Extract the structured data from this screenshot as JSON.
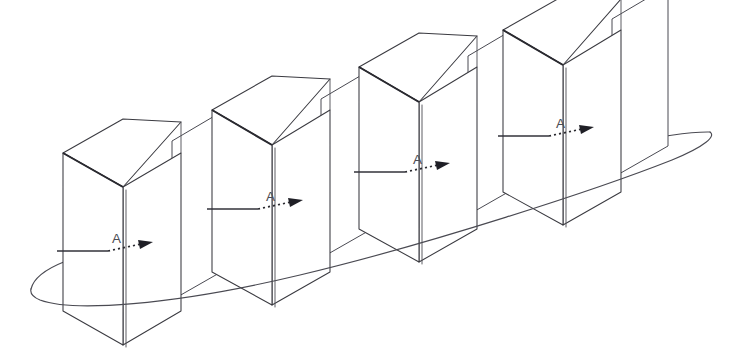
{
  "diagram": {
    "kind": "technical-line-drawing",
    "background_color": "#ffffff",
    "line_color": "#3a3a40",
    "accent_color": "#2a2a30",
    "canvas": {
      "width": 744,
      "height": 355
    },
    "units": [
      {
        "id": "unit-1",
        "label": "A",
        "label_x": 112,
        "label_y": 243,
        "box": {
          "front": "63,153 63,311 123,345 123,187",
          "right": "123,187 123,345 181,311 181,153",
          "top": "63,153 123,119 181,122 123,187",
          "bevel": "63,153 123,187"
        },
        "panel": "172,141 172,300 228,268 228,108",
        "lead_solid": {
          "x1": 57,
          "y1": 251,
          "x2": 108,
          "y2": 251
        },
        "lead_dotted": {
          "x1": 108,
          "y1": 251,
          "x2": 143,
          "y2": 244
        },
        "arrow_tip": {
          "x": 153,
          "y": 242
        }
      },
      {
        "id": "unit-2",
        "label": "A",
        "label_x": 266,
        "label_y": 201,
        "box": {
          "front": "212,110 212,272 272,305 272,145",
          "right": "272,145 272,305 330,272 330,110",
          "top": "212,110 272,76 330,79 272,145",
          "bevel": "212,110 272,145"
        },
        "panel": "321,99 321,258 377,226 377,66",
        "lead_solid": {
          "x1": 207,
          "y1": 209,
          "x2": 258,
          "y2": 209
        },
        "lead_dotted": {
          "x1": 258,
          "y1": 209,
          "x2": 293,
          "y2": 202
        },
        "arrow_tip": {
          "x": 303,
          "y": 200
        }
      },
      {
        "id": "unit-3",
        "label": "A",
        "label_x": 413,
        "label_y": 164,
        "box": {
          "front": "359,67 359,229 419,262 419,102",
          "right": "419,102 419,262 477,229 477,67",
          "top": "359,67 419,33 477,36 419,102",
          "bevel": "359,67 419,102"
        },
        "panel": "468,56 468,215 524,183 524,23",
        "lead_solid": {
          "x1": 354,
          "y1": 172,
          "x2": 405,
          "y2": 172
        },
        "lead_dotted": {
          "x1": 405,
          "y1": 172,
          "x2": 440,
          "y2": 165
        },
        "arrow_tip": {
          "x": 450,
          "y": 163
        }
      },
      {
        "id": "unit-4",
        "label": "A",
        "label_x": 556,
        "label_y": 128,
        "box": {
          "front": "503,30 503,192 563,225 563,65",
          "right": "563,65 563,225 621,192 621,30",
          "top": "503,30 563,-4 621,-1 563,65",
          "bevel": "503,30 563,65"
        },
        "panel": "612,19 612,178 668,146 668,-14",
        "lead_solid": {
          "x1": 498,
          "y1": 136,
          "x2": 549,
          "y2": 136
        },
        "lead_dotted": {
          "x1": 549,
          "y1": 136,
          "x2": 584,
          "y2": 129
        },
        "arrow_tip": {
          "x": 594,
          "y": 127
        }
      }
    ],
    "orbit": {
      "name": "orbit-ellipse",
      "left_tip": {
        "x": 31,
        "y": 289
      },
      "right_tip": {
        "x": 713,
        "y": 133
      },
      "description": "large tilted ellipse passing behind and in front of the box array"
    }
  }
}
